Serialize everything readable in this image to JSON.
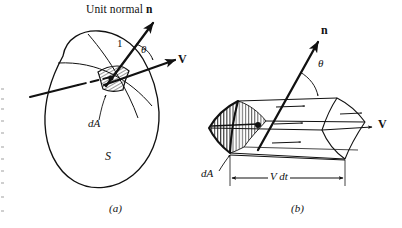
{
  "figure": {
    "caption_title": "Unit normal n",
    "panels": [
      {
        "id": "a",
        "label": "(a)",
        "labels": {
          "unit_length": "1",
          "theta": "θ",
          "velocity": "V",
          "area_element": "dA",
          "surface": "S"
        }
      },
      {
        "id": "b",
        "label": "(b)",
        "labels": {
          "normal": "n",
          "theta": "θ",
          "velocity": "V",
          "area_element": "dA",
          "length": "V dt"
        }
      }
    ],
    "colors": {
      "ink": "#111111",
      "background": "#ffffff",
      "thin_line": "#1a1a1a"
    }
  }
}
